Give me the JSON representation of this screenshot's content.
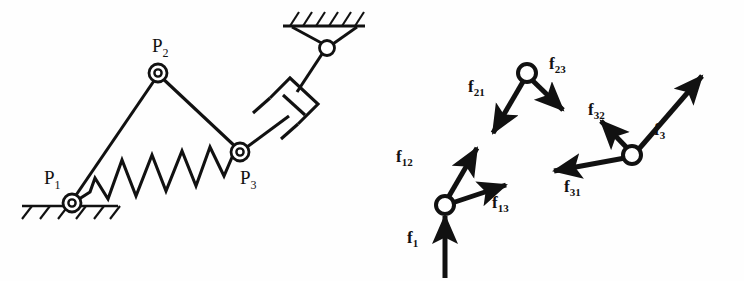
{
  "figure": {
    "panels": [
      {
        "id": "mechanism",
        "name": "Mechanism schematic with spring and damper"
      },
      {
        "id": "force-diagram",
        "name": "Free body force vector diagram"
      }
    ],
    "stroke_color": "#111111",
    "background_color": "#fefefe"
  },
  "mechanism": {
    "joints": [
      {
        "id": "P1",
        "label": "P",
        "sub": "1",
        "type": "pin-joint-grounded",
        "x": 72,
        "y": 203,
        "label_x": 44,
        "label_y": 168
      },
      {
        "id": "P2",
        "label": "P",
        "sub": "2",
        "type": "pin-joint",
        "x": 158,
        "y": 73,
        "label_x": 152,
        "label_y": 36
      },
      {
        "id": "P3",
        "label": "P",
        "sub": "3",
        "type": "pin-joint",
        "x": 240,
        "y": 152,
        "label_x": 240,
        "label_y": 168
      }
    ],
    "ground_supports": [
      {
        "id": "ground-bottom-left",
        "x1": 22,
        "y": 206,
        "x2": 118,
        "hatch_count": 6,
        "hatch_dir": "down-left"
      },
      {
        "id": "ground-top-right",
        "x1": 283,
        "y": 26,
        "x2": 363,
        "hatch_count": 6,
        "hatch_dir": "up-left"
      }
    ],
    "links": [
      {
        "id": "link-P1-P2",
        "from": "P1",
        "to": "P2"
      },
      {
        "id": "link-P2-P3",
        "from": "P2",
        "to": "P3"
      },
      {
        "id": "link-P3-damper",
        "from": "P3",
        "to": "damper-rod"
      }
    ],
    "spring": {
      "id": "spring-P1-P3",
      "from": "P1",
      "to": "P3",
      "coils": 5,
      "amplitude": 17
    },
    "damper": {
      "id": "damper-dashpot",
      "type": "dashpot",
      "pivot_x": 327,
      "pivot_y": 48
    },
    "wall_pivot": {
      "id": "wall-pivot-joint",
      "x": 327,
      "y": 48,
      "type": "pin-joint-grounded"
    }
  },
  "force_diagram": {
    "nodes": [
      {
        "id": "node-1",
        "x": 445,
        "y": 205
      },
      {
        "id": "node-2",
        "x": 527,
        "y": 73
      },
      {
        "id": "node-3",
        "x": 632,
        "y": 155
      }
    ],
    "vectors": [
      {
        "id": "f1",
        "label": "f",
        "sub": "1",
        "from_x": 445,
        "from_y": 278,
        "to_x": 445,
        "to_y": 212,
        "label_x": 407,
        "label_y": 236
      },
      {
        "id": "f12",
        "label": "f",
        "sub": "12",
        "from_x": 445,
        "from_y": 205,
        "to_x": 479,
        "to_y": 145,
        "label_x": 398,
        "label_y": 155
      },
      {
        "id": "f13",
        "label": "f",
        "sub": "13",
        "from_x": 445,
        "from_y": 205,
        "to_x": 510,
        "to_y": 183,
        "label_x": 494,
        "label_y": 201
      },
      {
        "id": "f21",
        "label": "f",
        "sub": "21",
        "from_x": 527,
        "from_y": 78,
        "to_x": 490,
        "to_y": 138,
        "label_x": 470,
        "label_y": 84
      },
      {
        "id": "f23",
        "label": "f",
        "sub": "23",
        "from_x": 532,
        "from_y": 78,
        "to_x": 566,
        "to_y": 113,
        "label_x": 551,
        "label_y": 61
      },
      {
        "id": "f32",
        "label": "f",
        "sub": "32",
        "from_x": 632,
        "from_y": 150,
        "to_x": 598,
        "to_y": 117,
        "label_x": 590,
        "label_y": 108
      },
      {
        "id": "f31",
        "label": "f",
        "sub": "31",
        "from_x": 628,
        "from_y": 157,
        "to_x": 549,
        "to_y": 172,
        "label_x": 566,
        "label_y": 184
      },
      {
        "id": "f3",
        "label": "f",
        "sub": "3",
        "from_x": 637,
        "from_y": 151,
        "to_x": 706,
        "to_y": 71,
        "label_x": 655,
        "label_y": 128
      }
    ]
  }
}
